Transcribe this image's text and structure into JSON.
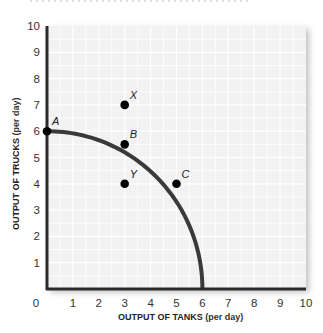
{
  "chart_data": {
    "type": "line",
    "title": "",
    "xlabel": {
      "bold": "OUTPUT OF TANKS",
      "normal": " (per day)"
    },
    "ylabel": {
      "bold": "OUTPUT OF TRUCKS",
      "normal": " (per day)"
    },
    "xlim": [
      0,
      10
    ],
    "ylim": [
      0,
      10
    ],
    "xticks": [
      "0",
      "1",
      "2",
      "3",
      "4",
      "5",
      "6",
      "7",
      "8",
      "9",
      "10"
    ],
    "yticks": [
      "1",
      "2",
      "3",
      "4",
      "5",
      "6",
      "7",
      "8",
      "9",
      "10"
    ],
    "grid": true,
    "series": [
      {
        "name": "Production possibilities curve",
        "color": "#3a3a3a",
        "points": [
          [
            0,
            6
          ],
          [
            1,
            5.95
          ],
          [
            2,
            5.8
          ],
          [
            3,
            5.5
          ],
          [
            4,
            4.95
          ],
          [
            5,
            4
          ],
          [
            5.5,
            3.2
          ],
          [
            5.8,
            2.2
          ],
          [
            6,
            0
          ]
        ]
      }
    ],
    "points": [
      {
        "label": "A",
        "x": 0,
        "y": 6
      },
      {
        "label": "B",
        "x": 3,
        "y": 5.5
      },
      {
        "label": "C",
        "x": 5,
        "y": 4
      },
      {
        "label": "X",
        "x": 3,
        "y": 7
      },
      {
        "label": "Y",
        "x": 3,
        "y": 4
      }
    ],
    "colors": {
      "plot_bg": "#f2f2f2",
      "grid": "#ffffff",
      "axis": "#2b2b2b",
      "point": "#000000"
    }
  }
}
